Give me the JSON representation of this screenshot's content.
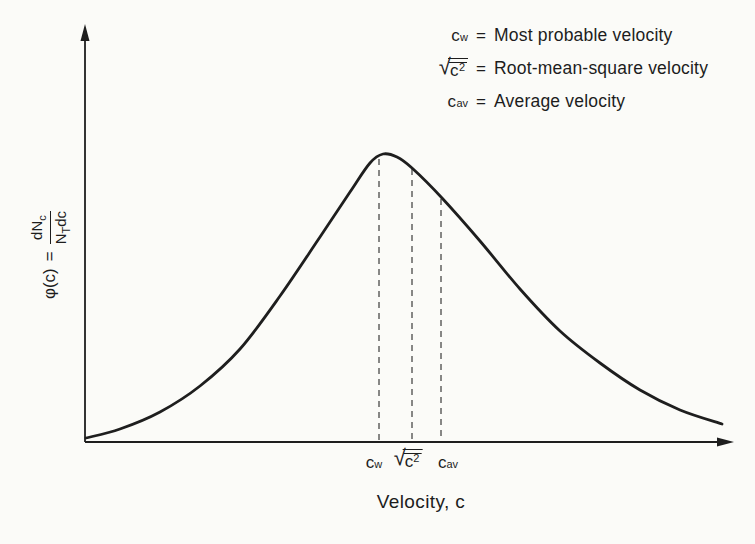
{
  "figure": {
    "background": "#fbfbf8",
    "ink": "#1d1d1d"
  },
  "y_axis_label": {
    "phi": "φ(c)",
    "equals": "=",
    "frac_num_main": "dN",
    "frac_num_sub": "c",
    "frac_den_main": "N",
    "frac_den_sub": "T",
    "frac_den_rest": "dc"
  },
  "x_axis_label": "Velocity, c",
  "x_ticks": [
    {
      "main": "c",
      "sub": "w"
    },
    {
      "radical_sign": "√",
      "main": "c",
      "sup": "2"
    },
    {
      "main": "c",
      "sub": "av"
    }
  ],
  "legend": {
    "items": [
      {
        "symbol_main": "c",
        "symbol_sub": "w",
        "equals": "=",
        "text": "Most probable velocity"
      },
      {
        "radical_sign": "√",
        "symbol_main": "c",
        "symbol_sup": "2",
        "equals": "=",
        "text": "Root-mean-square velocity"
      },
      {
        "symbol_main": "c",
        "symbol_sub": "av",
        "equals": "=",
        "text": "Average velocity"
      }
    ]
  },
  "chart_data": {
    "type": "line",
    "xlabel": "Velocity, c",
    "ylabel": "φ(c) = dN_c / (N_T dc)",
    "x_axis_ticks": [
      "c_w",
      "sqrt(mean(c^2))",
      "c_av"
    ],
    "axes_unlabeled_numeric": true,
    "grid": false,
    "legend_position": "top-right",
    "axis_px": {
      "origin": [
        85,
        442
      ],
      "y_top": 24,
      "x_right": 734
    },
    "curve_points_px": [
      [
        86,
        438
      ],
      [
        120,
        429
      ],
      [
        160,
        412
      ],
      [
        200,
        386
      ],
      [
        240,
        349
      ],
      [
        280,
        296
      ],
      [
        320,
        237
      ],
      [
        350,
        192
      ],
      [
        370,
        163
      ],
      [
        383,
        154
      ],
      [
        397,
        157
      ],
      [
        412,
        168
      ],
      [
        442,
        198
      ],
      [
        480,
        241
      ],
      [
        520,
        289
      ],
      [
        560,
        331
      ],
      [
        600,
        363
      ],
      [
        640,
        390
      ],
      [
        680,
        410
      ],
      [
        722,
        424
      ]
    ],
    "markers": [
      {
        "symbol": "c_w",
        "meaning": "Most probable velocity",
        "x_px": 379,
        "top_y_px": 159
      },
      {
        "symbol": "sqrt(mean(c^2))",
        "meaning": "Root-mean-square velocity",
        "x_px": 412,
        "top_y_px": 169
      },
      {
        "symbol": "c_av",
        "meaning": "Average velocity",
        "x_px": 441,
        "top_y_px": 199
      }
    ],
    "stroke": {
      "curve_color": "#1e1e1e",
      "curve_width": 2.8,
      "axis_color": "#1e1e1e",
      "axis_width": 1.8,
      "dash_color": "#3a3a3a",
      "dash_width": 1.2,
      "dash_pattern": "6 5"
    }
  }
}
